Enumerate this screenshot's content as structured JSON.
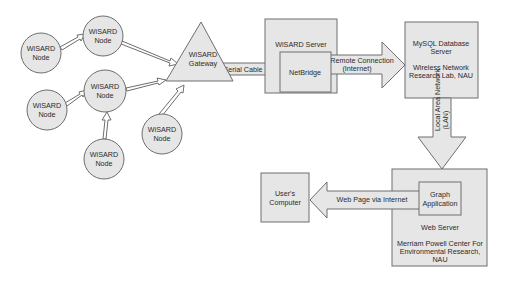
{
  "diagram": {
    "colors": {
      "fill": "#e6e6e6",
      "stroke": "#6e6e6e",
      "text": "#2a2a2a",
      "background": "#ffffff"
    },
    "nodes": [
      {
        "id": "node-1",
        "line1": "WiSARD",
        "line2": "Node",
        "cx": 41,
        "cy": 53,
        "r": 20
      },
      {
        "id": "node-2",
        "line1": "WiSARD",
        "line2": "Node",
        "cx": 103,
        "cy": 36,
        "r": 20
      },
      {
        "id": "node-3",
        "line1": "WiSARD",
        "line2": "Node",
        "cx": 105,
        "cy": 91,
        "r": 21
      },
      {
        "id": "node-4",
        "line1": "WiSARD",
        "line2": "Node",
        "cx": 47,
        "cy": 110,
        "r": 20
      },
      {
        "id": "node-5",
        "line1": "WiSARD",
        "line2": "Node",
        "cx": 104,
        "cy": 159,
        "r": 20
      },
      {
        "id": "node-6",
        "line1": "WiSARD",
        "line2": "Node",
        "cx": 162,
        "cy": 134,
        "r": 20
      }
    ],
    "gateway": {
      "line1": "WiSARD",
      "line2": "Gateway"
    },
    "wisard_server": {
      "title": "WiSARD Server",
      "inner": "NetBridge"
    },
    "mysql_server": {
      "line1": "MySQL Database",
      "line2": "Server",
      "line3": "Wireless Network",
      "line4": "Research Lab, NAU"
    },
    "web_server": {
      "inner_line1": "Graph",
      "inner_line2": "Application",
      "title": "Web Server",
      "line1": "Merriam Powell Center For",
      "line2": "Environmental Research,",
      "line3": "NAU"
    },
    "users_computer": {
      "line1": "User's",
      "line2": "Computer"
    },
    "connections": {
      "serial_cable": "Serial Cable",
      "remote_line1": "Remote Connection",
      "remote_line2": "(Internet)",
      "lan_line1": "Local Area Network",
      "lan_line2": "(LAN)",
      "web_page": "Web Page via Internet"
    }
  }
}
